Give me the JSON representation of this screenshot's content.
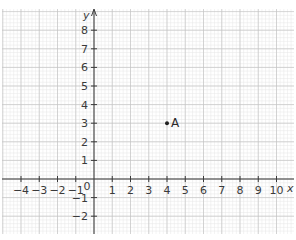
{
  "diagram": {
    "type": "coordinate-grid",
    "x_axis": {
      "label": "x",
      "min": -4,
      "max": 10,
      "ticks": [
        -4,
        -3,
        -2,
        -1,
        1,
        2,
        3,
        4,
        5,
        6,
        7,
        8,
        9,
        10
      ],
      "tick_labels": [
        "−4",
        "−3",
        "−2",
        "−1",
        "1",
        "2",
        "3",
        "4",
        "5",
        "6",
        "7",
        "8",
        "9",
        "10"
      ]
    },
    "y_axis": {
      "label": "y",
      "min": -2,
      "max": 8,
      "ticks": [
        8,
        7,
        6,
        5,
        4,
        3,
        2,
        1,
        -1,
        -2
      ],
      "tick_labels": [
        "8",
        "7",
        "6",
        "5",
        "4",
        "3",
        "2",
        "1",
        "−1",
        "−2"
      ]
    },
    "origin_label": "0",
    "points": [
      {
        "label": "A",
        "x": 4,
        "y": 3
      }
    ],
    "colors": {
      "major_grid": "#c4c4c4",
      "minor_grid": "#e6e6e6",
      "axis": "#3a3a3a",
      "text": "#3a3a3a"
    }
  }
}
